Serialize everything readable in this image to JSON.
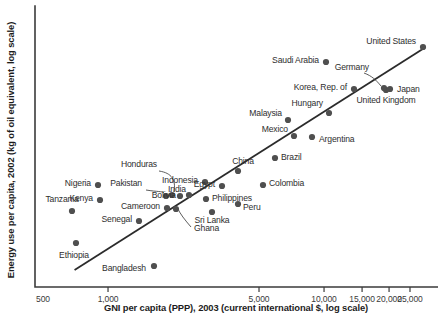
{
  "chart_data": {
    "type": "scatter",
    "title": "",
    "xlabel": "GNI per capita (PPP), 2003 (current international $, log scale)",
    "ylabel": "Energy use per capita, 2002 (kg of oil equivalent, log scale)",
    "xscale": "log",
    "yscale": "log",
    "xlim": [
      500,
      30000
    ],
    "ylim": [
      200,
      9000
    ],
    "grid": false,
    "legend": "none",
    "xticks": [
      {
        "value": 500,
        "label": "500"
      },
      {
        "value": 1000,
        "label": "1,000"
      },
      {
        "value": 5000,
        "label": "5,000"
      },
      {
        "value": 10000,
        "label": "10,000"
      },
      {
        "value": 15000,
        "label": "15,000"
      },
      {
        "value": 20000,
        "label": "20,000"
      },
      {
        "value": 25000,
        "label": "25,000"
      }
    ],
    "yticks": [],
    "trendline": {
      "label": "fitted regression line",
      "x0": 700,
      "y0": 255,
      "x1": 29500,
      "y1": 6100
    },
    "points": [
      {
        "name": "Ethiopia",
        "px": 76,
        "py": 243,
        "lx": 74,
        "ly": 258,
        "anchor": "middle"
      },
      {
        "name": "Tanzania",
        "px": 72,
        "py": 211,
        "lx": 62,
        "ly": 202,
        "anchor": "middle"
      },
      {
        "name": "Nigeria",
        "px": 98,
        "py": 185,
        "lx": 91,
        "ly": 186,
        "anchor": "end"
      },
      {
        "name": "Kenya",
        "px": 100,
        "py": 200,
        "lx": 93,
        "ly": 201,
        "anchor": "end"
      },
      {
        "name": "Bangladesh",
        "px": 154,
        "py": 266,
        "lx": 146,
        "ly": 271,
        "anchor": "end"
      },
      {
        "name": "Senegal",
        "px": 139,
        "py": 221,
        "lx": 132,
        "ly": 222,
        "anchor": "end"
      },
      {
        "name": "Cameroon",
        "px": 167,
        "py": 208,
        "lx": 160,
        "ly": 209,
        "anchor": "end"
      },
      {
        "name": "Ghana",
        "px": 176,
        "py": 209,
        "lx": 194,
        "ly": 231,
        "anchor": "start"
      },
      {
        "name": "Pakistan",
        "px": 166,
        "py": 196,
        "lx": 142,
        "ly": 186,
        "anchor": "end"
      },
      {
        "name": "Honduras",
        "px": 172,
        "py": 195,
        "lx": 157,
        "ly": 167,
        "anchor": "end"
      },
      {
        "name": "Bolivia",
        "px": 180,
        "py": 196,
        "lx": 176,
        "ly": 198,
        "anchor": "end"
      },
      {
        "name": "India",
        "px": 189,
        "py": 195,
        "lx": 186,
        "ly": 192,
        "anchor": "end"
      },
      {
        "name": "Sri Lanka",
        "px": 212,
        "py": 212,
        "lx": 212,
        "ly": 223,
        "anchor": "middle"
      },
      {
        "name": "Indonesia",
        "px": 205,
        "py": 182,
        "lx": 198,
        "ly": 183,
        "anchor": "end"
      },
      {
        "name": "Egypt",
        "px": 222,
        "py": 186,
        "lx": 215,
        "ly": 187,
        "anchor": "end"
      },
      {
        "name": "Philippines",
        "px": 206,
        "py": 199,
        "lx": 212,
        "ly": 201,
        "anchor": "start"
      },
      {
        "name": "Peru",
        "px": 238,
        "py": 204,
        "lx": 243,
        "ly": 210,
        "anchor": "start"
      },
      {
        "name": "China",
        "px": 238,
        "py": 171,
        "lx": 243,
        "ly": 164,
        "anchor": "middle"
      },
      {
        "name": "Colombia",
        "px": 263,
        "py": 185,
        "lx": 269,
        "ly": 186,
        "anchor": "start"
      },
      {
        "name": "Brazil",
        "px": 275,
        "py": 158,
        "lx": 281,
        "ly": 160,
        "anchor": "start"
      },
      {
        "name": "Mexico",
        "px": 294,
        "py": 136,
        "lx": 288,
        "ly": 132,
        "anchor": "end"
      },
      {
        "name": "Malaysia",
        "px": 288,
        "py": 120,
        "lx": 282,
        "ly": 116,
        "anchor": "end"
      },
      {
        "name": "Argentina",
        "px": 312,
        "py": 137,
        "lx": 319,
        "ly": 142,
        "anchor": "start"
      },
      {
        "name": "Hungary",
        "px": 329,
        "py": 113,
        "lx": 323,
        "ly": 106,
        "anchor": "end"
      },
      {
        "name": "Korea, Rep. of",
        "px": 354,
        "py": 89,
        "lx": 347,
        "ly": 90,
        "anchor": "end"
      },
      {
        "name": "Saudi Arabia",
        "px": 326,
        "py": 62,
        "lx": 319,
        "ly": 63,
        "anchor": "end"
      },
      {
        "name": "United Kingdom",
        "px": 386,
        "py": 90,
        "lx": 386,
        "ly": 103,
        "anchor": "middle"
      },
      {
        "name": "Germany",
        "px": 384,
        "py": 88,
        "lx": 369,
        "ly": 70,
        "anchor": "end"
      },
      {
        "name": "Japan",
        "px": 390,
        "py": 89,
        "lx": 397,
        "ly": 92,
        "anchor": "start"
      },
      {
        "name": "United States",
        "px": 423,
        "py": 47,
        "lx": 416,
        "ly": 44,
        "anchor": "end"
      }
    ],
    "leaders": [
      {
        "name": "honduras-leader",
        "d": "M 159 171 C 172 173 176 180 174 192"
      },
      {
        "name": "pakistan-leader",
        "d": "M 146 190 C 158 192 162 191 164 193"
      },
      {
        "name": "ghana-leader",
        "d": "M 191 227 C 185 220 180 214 177 207"
      },
      {
        "name": "germany-leader",
        "d": "M 364 73 C 372 76 376 80 381 86"
      }
    ]
  }
}
